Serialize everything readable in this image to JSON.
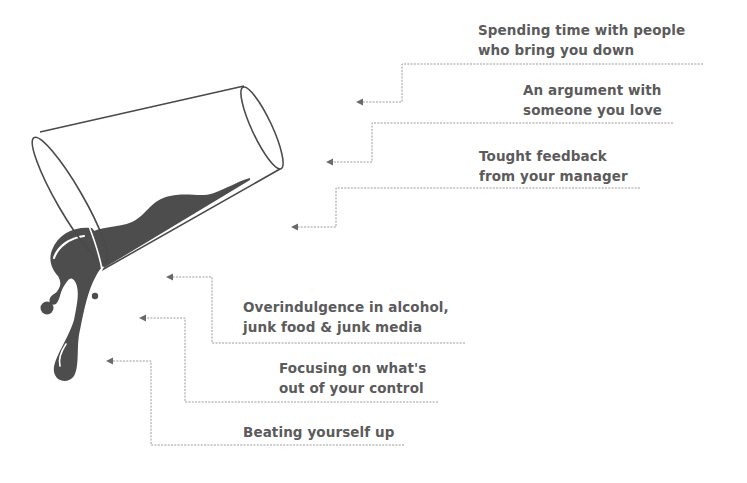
{
  "diagram": {
    "colors": {
      "text": "#5b5b5b",
      "liquid": "#4d4d4d",
      "glass_outline": "#4a4a4a",
      "connector": "#9a9a9a",
      "background": "#ffffff"
    },
    "items": [
      {
        "line1": "Spending time with people",
        "line2": "who bring you down"
      },
      {
        "line1": "An argument with",
        "line2": "someone you love"
      },
      {
        "line1": "Tought feedback",
        "line2": "from your manager"
      },
      {
        "line1": "Overindulgence in alcohol,",
        "line2": "junk food & junk media"
      },
      {
        "line1": "Focusing on what's",
        "line2": "out of your control"
      },
      {
        "line1": "Beating yourself up"
      }
    ]
  }
}
